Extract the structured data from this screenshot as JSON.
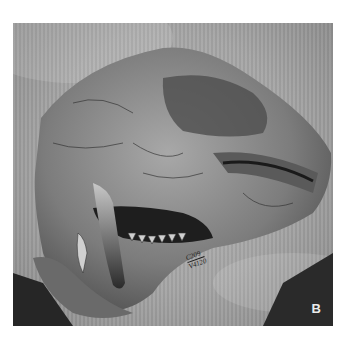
{
  "figure": {
    "panel_label": "B",
    "specimen_label": {
      "line1": "C209",
      "line2": "V4120"
    },
    "colors": {
      "background": "#ffffff",
      "cloth": "#b0b0b0",
      "bone_light": "#9a9a9a",
      "bone_dark": "#3a3a3a",
      "shadow": "#1a1a1a"
    }
  }
}
